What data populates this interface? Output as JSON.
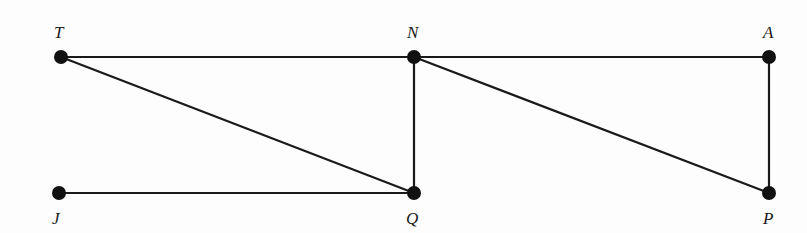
{
  "diagram": {
    "type": "graph",
    "colors": {
      "line": "#1a1a1a",
      "point": "#111111",
      "background": "#fdfdfd"
    },
    "points": [
      {
        "id": "T",
        "label": "T",
        "x": 61,
        "y": 57,
        "label_x": 54,
        "label_y": 38
      },
      {
        "id": "N",
        "label": "N",
        "x": 414,
        "y": 57,
        "label_x": 407,
        "label_y": 38
      },
      {
        "id": "A",
        "label": "A",
        "x": 769,
        "y": 57,
        "label_x": 763,
        "label_y": 38
      },
      {
        "id": "J",
        "label": "J",
        "x": 59,
        "y": 193,
        "label_x": 52,
        "label_y": 224
      },
      {
        "id": "Q",
        "label": "Q",
        "x": 414,
        "y": 193,
        "label_x": 406,
        "label_y": 224
      },
      {
        "id": "P",
        "label": "P",
        "x": 769,
        "y": 193,
        "label_x": 763,
        "label_y": 224
      }
    ],
    "edges": [
      {
        "from": "T",
        "to": "N"
      },
      {
        "from": "N",
        "to": "A"
      },
      {
        "from": "T",
        "to": "Q"
      },
      {
        "from": "N",
        "to": "Q"
      },
      {
        "from": "N",
        "to": "P"
      },
      {
        "from": "A",
        "to": "P"
      },
      {
        "from": "J",
        "to": "Q"
      }
    ]
  }
}
